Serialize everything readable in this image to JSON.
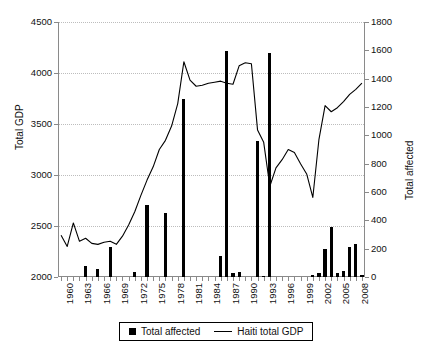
{
  "chart_data": {
    "type": "bar",
    "title": "",
    "xlabel": "",
    "ylabel": "Total GDP",
    "y2label": "Total affected",
    "ylim": [
      2000,
      4500
    ],
    "y2lim": [
      0,
      1800
    ],
    "ytick_labels": [
      "2000",
      "2500",
      "3000",
      "3500",
      "4000",
      "4500"
    ],
    "y2tick_labels": [
      "0",
      "200",
      "400",
      "600",
      "800",
      "1000",
      "1200",
      "1400",
      "1600",
      "1800"
    ],
    "xtick_labels": [
      "1960",
      "1963",
      "1966",
      "1969",
      "1972",
      "1975",
      "1978",
      "1981",
      "1984",
      "1987",
      "1990",
      "1993",
      "1996",
      "1999",
      "2002",
      "2005",
      "2008"
    ],
    "xlim": [
      1960,
      2009
    ],
    "grid": "horizontal-dotted",
    "legend_position": "below-axes",
    "categories": [
      1960,
      1961,
      1962,
      1963,
      1964,
      1965,
      1966,
      1967,
      1968,
      1969,
      1970,
      1971,
      1972,
      1973,
      1974,
      1975,
      1976,
      1977,
      1978,
      1979,
      1980,
      1981,
      1982,
      1983,
      1984,
      1985,
      1986,
      1987,
      1988,
      1989,
      1990,
      1991,
      1992,
      1993,
      1994,
      1995,
      1996,
      1997,
      1998,
      1999,
      2000,
      2001,
      2002,
      2003,
      2004,
      2005,
      2006,
      2007,
      2008,
      2009
    ],
    "series": [
      {
        "name": "Total affected",
        "type": "bar",
        "axis": "right",
        "color": "#000000",
        "values": [
          0,
          0,
          0,
          0,
          80,
          0,
          60,
          0,
          210,
          0,
          0,
          0,
          35,
          0,
          505,
          0,
          0,
          455,
          0,
          0,
          1255,
          0,
          0,
          0,
          0,
          0,
          145,
          1595,
          25,
          35,
          0,
          0,
          960,
          10,
          1580,
          0,
          0,
          0,
          0,
          0,
          0,
          15,
          25,
          195,
          350,
          30,
          40,
          210,
          235,
          15
        ]
      },
      {
        "name": "Haiti total GDP",
        "type": "line",
        "axis": "left",
        "color": "#000000",
        "values": [
          2410,
          2300,
          2530,
          2350,
          2380,
          2330,
          2320,
          2340,
          2350,
          2320,
          2400,
          2510,
          2640,
          2800,
          2950,
          3080,
          3250,
          3340,
          3480,
          3700,
          4110,
          3930,
          3870,
          3880,
          3900,
          3910,
          3920,
          3900,
          3890,
          4070,
          4100,
          4090,
          3440,
          3320,
          2890,
          3070,
          3150,
          3250,
          3220,
          3110,
          3010,
          2780,
          3350,
          3680,
          3620,
          3660,
          3720,
          3790,
          3840,
          3900
        ]
      }
    ]
  },
  "legend": {
    "items": [
      {
        "label": "Total affected",
        "marker": "square"
      },
      {
        "label": "Haiti total GDP",
        "marker": "line"
      }
    ]
  }
}
